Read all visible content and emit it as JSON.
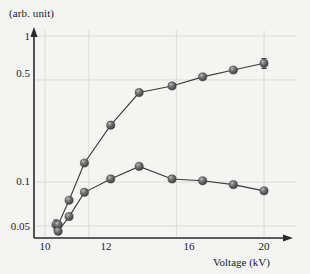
{
  "chart_data": {
    "type": "line",
    "title": "",
    "xlabel": "Voltage (kV)",
    "ylabel": "(arb. unit)",
    "yscale": "log",
    "xlim": [
      9.6,
      20.9
    ],
    "ylim": [
      0.042,
      1.0
    ],
    "grid": true,
    "legend_position": "none",
    "xticks": [
      10,
      12,
      16,
      20
    ],
    "xtick_labels": [
      "10",
      "12",
      "16",
      "20"
    ],
    "yticks": [
      0.05,
      0.1,
      0.5,
      1
    ],
    "ytick_labels": [
      "0.05",
      "0.1",
      "0.5",
      "1"
    ],
    "ytop_label": "1",
    "series": [
      {
        "name": "upper-curve",
        "x": [
          10.5,
          10.6,
          11.1,
          11.8,
          13.0,
          14.3,
          15.8,
          17.2,
          18.6,
          20.0
        ],
        "y": [
          0.051,
          0.051,
          0.075,
          0.135,
          0.245,
          0.41,
          0.455,
          0.525,
          0.585,
          0.65
        ],
        "errors": [
          0.004,
          0,
          0,
          0,
          0,
          0,
          0,
          0,
          0,
          0.05
        ]
      },
      {
        "name": "lower-curve",
        "x": [
          10.6,
          11.1,
          11.8,
          13.0,
          14.3,
          15.8,
          17.2,
          18.6,
          20.0
        ],
        "y": [
          0.046,
          0.058,
          0.085,
          0.105,
          0.128,
          0.105,
          0.102,
          0.096,
          0.087
        ],
        "errors": [
          0,
          0,
          0,
          0,
          0,
          0,
          0,
          0,
          0
        ]
      }
    ]
  },
  "axes": {
    "y_title": "(arb. unit)",
    "x_title": "Voltage (kV)",
    "ytick_top": "1",
    "ytick_high": "0.5",
    "ytick_mid": "0.1",
    "ytick_low": "0.05",
    "xtick_0": "10",
    "xtick_1": "12",
    "xtick_2": "16",
    "xtick_3": "20"
  },
  "style": {
    "background": "#f4f4f2",
    "axis_color": "#2a2a2a",
    "grid_color": "#d8d8d6",
    "marker_color": "#5b5b5b",
    "marker_highlight": "#b9b9b9",
    "line_color": "#3a3a3a",
    "text_color": "#1c1c1c"
  }
}
